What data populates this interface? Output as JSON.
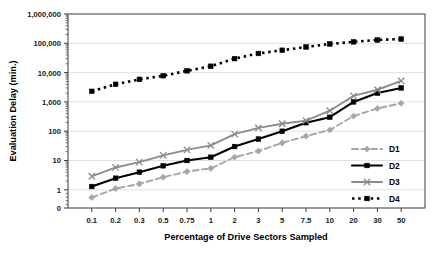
{
  "chart_data": {
    "type": "line",
    "title": "",
    "xlabel": "Percentage of Drive Sectors Sampled",
    "ylabel": "Evaluation Delay (min.)",
    "categories": [
      "0.1",
      "0.2",
      "0.3",
      "0.5",
      "0.75",
      "1",
      "2",
      "3",
      "5",
      "7.5",
      "10",
      "20",
      "30",
      "50"
    ],
    "yscale": "log",
    "ylim": [
      1,
      1000000
    ],
    "ytick_labels": [
      "1,000,000",
      "100,000",
      "10,000",
      "1,000",
      "100",
      "10",
      "1",
      "0"
    ],
    "ytick_values": [
      1000000,
      100000,
      10000,
      1000,
      100,
      10,
      1,
      0
    ],
    "grid": true,
    "grid_axis": "y",
    "legend_position": "right-inside",
    "series": [
      {
        "name": "D1",
        "color": "#a6a6a6",
        "style": "dashed",
        "marker": "diamond",
        "values": [
          0.55,
          1.1,
          1.6,
          2.7,
          4.2,
          5.4,
          13,
          21,
          40,
          68,
          110,
          330,
          600,
          900
        ]
      },
      {
        "name": "D2",
        "color": "#000000",
        "style": "solid",
        "marker": "square",
        "values": [
          1.3,
          2.5,
          4.0,
          6.6,
          10,
          13,
          30,
          54,
          100,
          195,
          300,
          1000,
          2000,
          3000
        ]
      },
      {
        "name": "D3",
        "color": "#8c8c8c",
        "style": "solid",
        "marker": "cross",
        "values": [
          2.9,
          5.8,
          8.8,
          15,
          23,
          33,
          80,
          130,
          180,
          230,
          500,
          1600,
          2600,
          5200
        ]
      },
      {
        "name": "D4",
        "color": "#000000",
        "style": "dotted",
        "marker": "square",
        "values": [
          2300,
          4000,
          5900,
          7800,
          11500,
          16500,
          30000,
          45000,
          58000,
          75000,
          95000,
          112000,
          130000,
          140000
        ]
      }
    ]
  },
  "legend": {
    "items": [
      {
        "label": "D1"
      },
      {
        "label": "D2"
      },
      {
        "label": "D3"
      },
      {
        "label": "D4"
      }
    ]
  }
}
